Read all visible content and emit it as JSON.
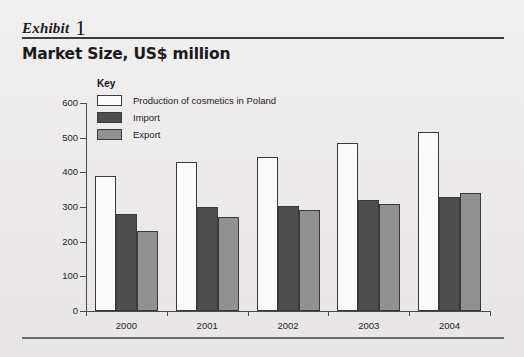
{
  "exhibit": {
    "word": "Exhibit",
    "number": "1"
  },
  "title": "Market Size, US$ million",
  "legend": {
    "title": "Key",
    "items": [
      {
        "label": "Production of cosmetics in Poland",
        "color": "#fbfbfb",
        "key": "production"
      },
      {
        "label": "Import",
        "color": "#4e4e4e",
        "key": "import"
      },
      {
        "label": "Export",
        "color": "#919191",
        "key": "export"
      }
    ]
  },
  "chart_data": {
    "type": "bar",
    "title": "Market Size, US$ million",
    "xlabel": "",
    "ylabel": "",
    "ylim": [
      0,
      600
    ],
    "yticks": [
      0,
      100,
      200,
      300,
      400,
      500,
      600
    ],
    "ytick_labels": [
      "0",
      "100",
      "200",
      "300",
      "400",
      "500",
      "600"
    ],
    "grid": false,
    "legend_position": "top-left-inside",
    "categories": [
      "2000",
      "2001",
      "2002",
      "2003",
      "2004"
    ],
    "series": [
      {
        "name": "Production of cosmetics in Poland",
        "color": "#fbfbfb",
        "values": [
          390,
          430,
          445,
          485,
          515
        ]
      },
      {
        "name": "Import",
        "color": "#4e4e4e",
        "values": [
          280,
          300,
          303,
          320,
          330
        ]
      },
      {
        "name": "Export",
        "color": "#919191",
        "values": [
          230,
          270,
          290,
          310,
          340
        ]
      }
    ]
  }
}
